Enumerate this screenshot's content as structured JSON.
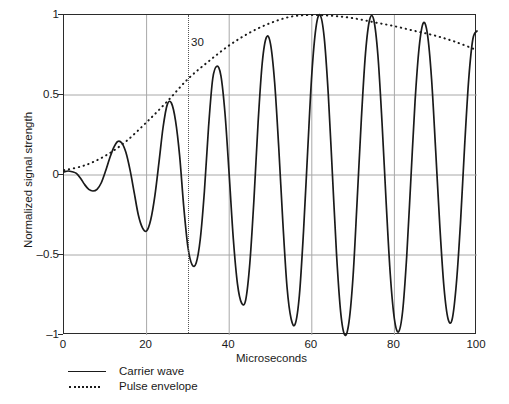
{
  "chart_data": {
    "type": "line",
    "title": "",
    "xlabel": "Microseconds",
    "ylabel": "Normalized signal strength",
    "xlim": [
      0,
      100
    ],
    "ylim": [
      -1,
      1
    ],
    "xticks": [
      "0",
      "20",
      "40",
      "60",
      "80",
      "100"
    ],
    "xtick_values": [
      0,
      20,
      40,
      60,
      80,
      100
    ],
    "yticks": [
      "1",
      "0.5",
      "0",
      "–0.5",
      "–1"
    ],
    "ytick_values": [
      1,
      0.5,
      0,
      -0.5,
      -1
    ],
    "grid": true,
    "gridlines_x": [
      20,
      40,
      60,
      80
    ],
    "gridlines_y": [
      -0.5,
      0,
      0.5
    ],
    "legend_position": "below-left",
    "annotations": [
      {
        "name": "pulse-start-marker",
        "label": "30",
        "x": 30,
        "style": "vertical-dotted-line"
      }
    ],
    "series": [
      {
        "name": "Carrier wave",
        "style": "solid",
        "color": "#1a1a1a",
        "period": 10.3,
        "x": [
          0,
          1,
          2,
          3,
          4,
          5,
          6,
          7,
          8,
          9,
          10,
          11,
          12,
          13,
          14,
          15,
          16,
          17,
          18,
          19,
          20,
          21,
          22,
          23,
          24,
          25,
          26,
          27,
          28,
          29,
          30,
          31,
          32,
          33,
          34,
          35,
          36,
          37,
          38,
          39,
          40,
          41,
          42,
          43,
          44,
          45,
          46,
          47,
          48,
          49,
          50,
          51,
          52,
          53,
          54,
          55,
          56,
          57,
          58,
          59,
          60,
          61,
          62,
          63,
          64,
          65,
          66,
          67,
          68,
          69,
          70,
          71,
          72,
          73,
          74,
          75,
          76,
          77,
          78,
          79,
          80,
          81,
          82,
          83,
          84,
          85,
          86,
          87,
          88,
          89,
          90,
          91,
          92,
          93,
          94,
          95,
          96,
          97,
          98,
          99,
          100
        ],
        "y": [
          0.02,
          0.025,
          0.02,
          0.01,
          -0.02,
          -0.06,
          -0.09,
          -0.1,
          -0.09,
          -0.05,
          0.02,
          0.1,
          0.17,
          0.21,
          0.2,
          0.14,
          0.03,
          -0.11,
          -0.25,
          -0.33,
          -0.35,
          -0.28,
          -0.13,
          0.08,
          0.3,
          0.44,
          0.45,
          0.34,
          0.12,
          -0.2,
          -0.45,
          -0.56,
          -0.55,
          -0.4,
          -0.1,
          0.3,
          0.6,
          0.68,
          0.62,
          0.38,
          0.0,
          -0.4,
          -0.68,
          -0.8,
          -0.78,
          -0.55,
          -0.15,
          0.33,
          0.7,
          0.86,
          0.82,
          0.58,
          0.17,
          -0.3,
          -0.7,
          -0.9,
          -0.93,
          -0.75,
          -0.35,
          0.15,
          0.63,
          0.92,
          1.0,
          0.86,
          0.5,
          0.0,
          -0.5,
          -0.86,
          -1.0,
          -0.92,
          -0.63,
          -0.15,
          0.35,
          0.76,
          0.97,
          0.97,
          0.75,
          0.33,
          -0.17,
          -0.62,
          -0.9,
          -0.98,
          -0.85,
          -0.5,
          -0.02,
          0.46,
          0.8,
          0.95,
          0.88,
          0.6,
          0.15,
          -0.32,
          -0.7,
          -0.9,
          -0.9,
          -0.68,
          -0.3,
          0.18,
          0.6,
          0.85,
          0.9
        ]
      },
      {
        "name": "Pulse envelope",
        "style": "dotted",
        "color": "#1a1a1a",
        "x": [
          0,
          5,
          10,
          15,
          20,
          25,
          30,
          35,
          40,
          45,
          50,
          55,
          60,
          65,
          70,
          75,
          80,
          85,
          90,
          95,
          100
        ],
        "y": [
          0.03,
          0.06,
          0.12,
          0.21,
          0.33,
          0.46,
          0.6,
          0.71,
          0.81,
          0.89,
          0.95,
          0.99,
          1.0,
          0.995,
          0.98,
          0.955,
          0.93,
          0.9,
          0.87,
          0.83,
          0.78
        ]
      }
    ]
  },
  "legend": {
    "items": [
      {
        "label": "Carrier wave",
        "style": "solid"
      },
      {
        "label": "Pulse envelope",
        "style": "dotted"
      }
    ]
  }
}
